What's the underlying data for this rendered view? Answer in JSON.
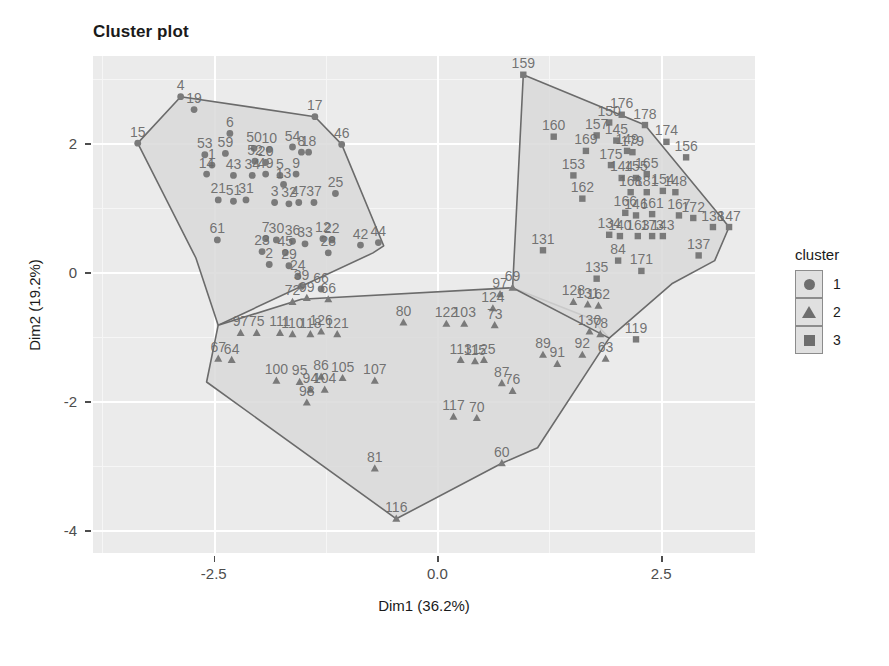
{
  "title": "Cluster plot",
  "axes": {
    "x": {
      "label": "Dim1 (36.2%)",
      "ticks": [
        "-2.5",
        "0.0",
        "2.5"
      ],
      "tick_values": [
        -2.5,
        0.0,
        2.5
      ],
      "range": [
        -3.85,
        3.55
      ]
    },
    "y": {
      "label": "Dim2 (19.2%)",
      "ticks": [
        "2",
        "0",
        "-2",
        "-4"
      ],
      "tick_values": [
        2,
        0,
        -2,
        -4
      ],
      "range": [
        -4.35,
        3.35
      ]
    }
  },
  "legend": {
    "title": "cluster",
    "items": [
      {
        "label": "1",
        "shape": "circle-icon",
        "color": "#6e6e6e"
      },
      {
        "label": "2",
        "shape": "triangle-icon",
        "color": "#6e6e6e"
      },
      {
        "label": "3",
        "shape": "square-icon",
        "color": "#6e6e6e"
      }
    ]
  },
  "colors": {
    "panel_bg": "#ebebeb",
    "grid_major": "#ffffff",
    "grid_minor": "#f6f6f6",
    "hull_fill": "#d9d9d9",
    "hull_stroke": "#6b6b6b",
    "point": "#7a7a7a",
    "text": "#1a1a1a",
    "tick_text": "#4d4d4d"
  },
  "chart_data": {
    "type": "scatter",
    "title": "Cluster plot",
    "xlabel": "Dim1 (36.2%)",
    "ylabel": "Dim2 (19.2%)",
    "xlim": [
      -3.85,
      3.55
    ],
    "ylim": [
      -4.35,
      3.35
    ],
    "grid": true,
    "legend_position": "right",
    "legend_title": "cluster",
    "series": [
      {
        "name": "1",
        "shape": "circle",
        "color": "#7a7a7a",
        "hull": [
          [
            -3.35,
            2.0
          ],
          [
            -2.87,
            2.72
          ],
          [
            -1.37,
            2.41
          ],
          [
            -1.07,
            1.98
          ],
          [
            -0.6,
            0.41
          ],
          [
            -0.72,
            0.3
          ],
          [
            -2.45,
            -0.82
          ],
          [
            -2.7,
            0.22
          ]
        ],
        "points": [
          {
            "label": "15",
            "x": -3.35,
            "y": 2.0
          },
          {
            "label": "4",
            "x": -2.87,
            "y": 2.72
          },
          {
            "label": "19",
            "x": -2.72,
            "y": 2.52
          },
          {
            "label": "17",
            "x": -1.37,
            "y": 2.41
          },
          {
            "label": "6",
            "x": -2.32,
            "y": 2.15
          },
          {
            "label": "46",
            "x": -1.07,
            "y": 1.98
          },
          {
            "label": "53",
            "x": -2.6,
            "y": 1.82
          },
          {
            "label": "59",
            "x": -2.37,
            "y": 1.84
          },
          {
            "label": "50",
            "x": -2.05,
            "y": 1.92
          },
          {
            "label": "54",
            "x": -1.62,
            "y": 1.94
          },
          {
            "label": "10",
            "x": -1.88,
            "y": 1.9
          },
          {
            "label": "8",
            "x": -1.52,
            "y": 1.86
          },
          {
            "label": "18",
            "x": -1.44,
            "y": 1.86
          },
          {
            "label": "1",
            "x": -2.52,
            "y": 1.66
          },
          {
            "label": "52",
            "x": -2.04,
            "y": 1.72
          },
          {
            "label": "14",
            "x": -2.58,
            "y": 1.52
          },
          {
            "label": "43",
            "x": -2.28,
            "y": 1.5
          },
          {
            "label": "34",
            "x": -2.07,
            "y": 1.5
          },
          {
            "label": "49",
            "x": -1.92,
            "y": 1.52
          },
          {
            "label": "5",
            "x": -1.76,
            "y": 1.5
          },
          {
            "label": "9",
            "x": -1.58,
            "y": 1.52
          },
          {
            "label": "20",
            "x": -1.92,
            "y": 1.7
          },
          {
            "label": "21",
            "x": -2.45,
            "y": 1.12
          },
          {
            "label": "51",
            "x": -2.28,
            "y": 1.1
          },
          {
            "label": "31",
            "x": -2.14,
            "y": 1.12
          },
          {
            "label": "3",
            "x": -1.82,
            "y": 1.08
          },
          {
            "label": "32",
            "x": -1.66,
            "y": 1.06
          },
          {
            "label": "47",
            "x": -1.55,
            "y": 1.08
          },
          {
            "label": "37",
            "x": -1.38,
            "y": 1.08
          },
          {
            "label": "25",
            "x": -1.14,
            "y": 1.22
          },
          {
            "label": "61",
            "x": -2.46,
            "y": 0.5
          },
          {
            "label": "7",
            "x": -1.92,
            "y": 0.52
          },
          {
            "label": "30",
            "x": -1.8,
            "y": 0.5
          },
          {
            "label": "36",
            "x": -1.62,
            "y": 0.48
          },
          {
            "label": "33",
            "x": -1.48,
            "y": 0.44
          },
          {
            "label": "12",
            "x": -1.28,
            "y": 0.52
          },
          {
            "label": "22",
            "x": -1.18,
            "y": 0.5
          },
          {
            "label": "42",
            "x": -0.86,
            "y": 0.42
          },
          {
            "label": "44",
            "x": -0.66,
            "y": 0.46
          },
          {
            "label": "23",
            "x": -1.96,
            "y": 0.32
          },
          {
            "label": "45",
            "x": -1.7,
            "y": 0.3
          },
          {
            "label": "28",
            "x": -1.22,
            "y": 0.3
          },
          {
            "label": "2",
            "x": -1.88,
            "y": 0.12
          },
          {
            "label": "29",
            "x": -1.66,
            "y": 0.1
          },
          {
            "label": "24",
            "x": -1.56,
            "y": -0.06
          },
          {
            "label": "39",
            "x": -1.52,
            "y": -0.22
          },
          {
            "label": "66",
            "x": -1.3,
            "y": -0.26
          },
          {
            "label": "13",
            "x": -1.72,
            "y": 1.36
          }
        ]
      },
      {
        "name": "2",
        "shape": "triangle",
        "color": "#7a7a7a",
        "hull": [
          [
            -2.45,
            -0.82
          ],
          [
            -1.52,
            -0.42
          ],
          [
            0.84,
            -0.24
          ],
          [
            1.72,
            -0.72
          ],
          [
            1.92,
            -1.02
          ],
          [
            1.12,
            -2.72
          ],
          [
            0.72,
            -2.96
          ],
          [
            -0.46,
            -3.82
          ],
          [
            -2.58,
            -1.7
          ]
        ],
        "points": [
          {
            "label": "69",
            "x": 0.84,
            "y": -0.24
          },
          {
            "label": "97",
            "x": 0.7,
            "y": -0.34
          },
          {
            "label": "72",
            "x": -1.62,
            "y": -0.46
          },
          {
            "label": "99",
            "x": -1.46,
            "y": -0.4
          },
          {
            "label": "66",
            "x": -1.22,
            "y": -0.42
          },
          {
            "label": "124",
            "x": 0.62,
            "y": -0.56
          },
          {
            "label": "128",
            "x": 1.52,
            "y": -0.46
          },
          {
            "label": "131",
            "x": 1.68,
            "y": -0.5
          },
          {
            "label": "162",
            "x": 1.8,
            "y": -0.52
          },
          {
            "label": "80",
            "x": -0.38,
            "y": -0.78
          },
          {
            "label": "122",
            "x": 0.1,
            "y": -0.8
          },
          {
            "label": "103",
            "x": 0.3,
            "y": -0.8
          },
          {
            "label": "73",
            "x": 0.64,
            "y": -0.82
          },
          {
            "label": "75",
            "x": -2.02,
            "y": -0.94
          },
          {
            "label": "97b",
            "x": -2.2,
            "y": -0.94
          },
          {
            "label": "111",
            "x": -1.76,
            "y": -0.94
          },
          {
            "label": "110",
            "x": -1.62,
            "y": -0.96
          },
          {
            "label": "118",
            "x": -1.42,
            "y": -0.96
          },
          {
            "label": "126",
            "x": -1.3,
            "y": -0.92
          },
          {
            "label": "121",
            "x": -1.12,
            "y": -0.96
          },
          {
            "label": "130",
            "x": 1.7,
            "y": -0.92
          },
          {
            "label": "78",
            "x": 1.82,
            "y": -0.96
          },
          {
            "label": "67",
            "x": -2.45,
            "y": -1.34
          },
          {
            "label": "64",
            "x": -2.3,
            "y": -1.36
          },
          {
            "label": "89",
            "x": 1.18,
            "y": -1.28
          },
          {
            "label": "92",
            "x": 1.62,
            "y": -1.28
          },
          {
            "label": "91",
            "x": 1.34,
            "y": -1.42
          },
          {
            "label": "113",
            "x": 0.26,
            "y": -1.36
          },
          {
            "label": "125",
            "x": 0.52,
            "y": -1.36
          },
          {
            "label": "115",
            "x": 0.42,
            "y": -1.38
          },
          {
            "label": "63",
            "x": 1.88,
            "y": -1.34
          },
          {
            "label": "100",
            "x": -1.8,
            "y": -1.68
          },
          {
            "label": "95",
            "x": -1.54,
            "y": -1.7
          },
          {
            "label": "86",
            "x": -1.3,
            "y": -1.62
          },
          {
            "label": "105",
            "x": -1.06,
            "y": -1.64
          },
          {
            "label": "107",
            "x": -0.7,
            "y": -1.68
          },
          {
            "label": "94",
            "x": -1.42,
            "y": -1.82
          },
          {
            "label": "104",
            "x": -1.26,
            "y": -1.82
          },
          {
            "label": "87",
            "x": 0.72,
            "y": -1.72
          },
          {
            "label": "76",
            "x": 0.84,
            "y": -1.84
          },
          {
            "label": "98",
            "x": -1.46,
            "y": -2.02
          },
          {
            "label": "70",
            "x": 0.44,
            "y": -2.26
          },
          {
            "label": "117",
            "x": 0.18,
            "y": -2.24
          },
          {
            "label": "60",
            "x": 0.72,
            "y": -2.96
          },
          {
            "label": "81",
            "x": -0.7,
            "y": -3.04
          },
          {
            "label": "116",
            "x": -0.46,
            "y": -3.82
          }
        ]
      },
      {
        "name": "3",
        "shape": "square",
        "color": "#7a7a7a",
        "hull": [
          [
            0.96,
            3.06
          ],
          [
            2.32,
            2.28
          ],
          [
            3.26,
            0.7
          ],
          [
            3.1,
            0.18
          ],
          [
            2.62,
            -0.18
          ],
          [
            1.92,
            -1.02
          ],
          [
            0.84,
            -0.24
          ]
        ],
        "points": [
          {
            "label": "159",
            "x": 0.96,
            "y": 3.06
          },
          {
            "label": "176",
            "x": 2.06,
            "y": 2.44
          },
          {
            "label": "178",
            "x": 2.32,
            "y": 2.28
          },
          {
            "label": "160",
            "x": 1.3,
            "y": 2.1
          },
          {
            "label": "150",
            "x": 1.92,
            "y": 2.32
          },
          {
            "label": "157",
            "x": 1.78,
            "y": 2.12
          },
          {
            "label": "145",
            "x": 2.0,
            "y": 2.04
          },
          {
            "label": "174",
            "x": 2.56,
            "y": 2.02
          },
          {
            "label": "169",
            "x": 1.66,
            "y": 1.88
          },
          {
            "label": "149",
            "x": 2.12,
            "y": 1.88
          },
          {
            "label": "179",
            "x": 2.18,
            "y": 1.86
          },
          {
            "label": "156",
            "x": 2.78,
            "y": 1.78
          },
          {
            "label": "153",
            "x": 1.52,
            "y": 1.5
          },
          {
            "label": "175",
            "x": 1.94,
            "y": 1.66
          },
          {
            "label": "144",
            "x": 2.06,
            "y": 1.46
          },
          {
            "label": "155",
            "x": 2.22,
            "y": 1.46
          },
          {
            "label": "165",
            "x": 2.34,
            "y": 1.52
          },
          {
            "label": "168",
            "x": 2.16,
            "y": 1.24
          },
          {
            "label": "181",
            "x": 2.34,
            "y": 1.24
          },
          {
            "label": "154",
            "x": 2.52,
            "y": 1.26
          },
          {
            "label": "148",
            "x": 2.66,
            "y": 1.24
          },
          {
            "label": "162",
            "x": 1.62,
            "y": 1.14
          },
          {
            "label": "166",
            "x": 2.1,
            "y": 0.92
          },
          {
            "label": "146",
            "x": 2.22,
            "y": 0.88
          },
          {
            "label": "161",
            "x": 2.4,
            "y": 0.9
          },
          {
            "label": "167",
            "x": 2.7,
            "y": 0.88
          },
          {
            "label": "172",
            "x": 2.86,
            "y": 0.84
          },
          {
            "label": "138",
            "x": 3.08,
            "y": 0.7
          },
          {
            "label": "147",
            "x": 3.26,
            "y": 0.7
          },
          {
            "label": "134",
            "x": 1.92,
            "y": 0.58
          },
          {
            "label": "140",
            "x": 2.04,
            "y": 0.56
          },
          {
            "label": "163",
            "x": 2.24,
            "y": 0.56
          },
          {
            "label": "173",
            "x": 2.4,
            "y": 0.56
          },
          {
            "label": "143",
            "x": 2.52,
            "y": 0.56
          },
          {
            "label": "137",
            "x": 2.92,
            "y": 0.26
          },
          {
            "label": "84",
            "x": 2.02,
            "y": 0.18
          },
          {
            "label": "171",
            "x": 2.28,
            "y": 0.02
          },
          {
            "label": "135",
            "x": 1.78,
            "y": -0.1
          },
          {
            "label": "131",
            "x": 1.18,
            "y": 0.34
          },
          {
            "label": "119",
            "x": 2.22,
            "y": -1.04
          }
        ]
      }
    ]
  }
}
